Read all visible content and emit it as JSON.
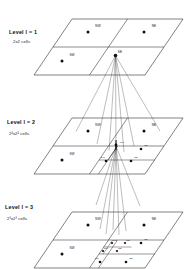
{
  "figure": {
    "type": "hierarchical-quadtree-pyramid",
    "background": "#ffffff",
    "ink": "#111111",
    "width": 196,
    "height": 269
  },
  "levels": [
    {
      "id": "level-1",
      "title": "Level l = 1",
      "subtitle": "2x2 cells",
      "cells": [
        "NW",
        "NE",
        "SW",
        "SE"
      ],
      "subdivided_cell": "SE"
    },
    {
      "id": "level-2",
      "title": "Level l = 2",
      "subtitle": "2²x2² cells",
      "cells": [
        "NW",
        "NE",
        "SW",
        "SE"
      ],
      "subcells": [
        "NW",
        "NE",
        "SW",
        "SE"
      ],
      "subdivided_cell": "SE"
    },
    {
      "id": "level-3",
      "title": "Level l = 3",
      "subtitle": "2³x2³ cells",
      "cells": [
        "NW",
        "NE",
        "SW",
        "SE"
      ],
      "subcells": [
        "NW",
        "NE",
        "SW",
        "SE"
      ],
      "subsubcells": [
        "NW",
        "NE",
        "SW",
        "SE"
      ],
      "subdivided_cell": "NW"
    }
  ],
  "labels": {
    "nw": "NW",
    "ne": "NE",
    "sw": "SW",
    "se": "SE"
  }
}
